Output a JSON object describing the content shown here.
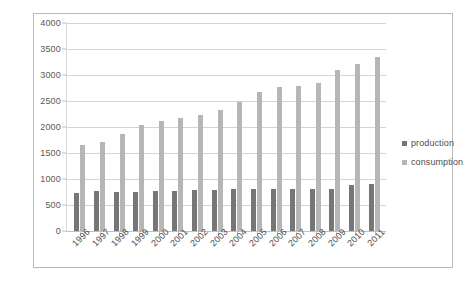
{
  "chart_data": {
    "type": "bar",
    "title": "",
    "xlabel": "",
    "ylabel": "",
    "ylim": [
      0,
      4000
    ],
    "y_ticks": [
      0,
      500,
      1000,
      1500,
      2000,
      2500,
      3000,
      3500,
      4000
    ],
    "grid": true,
    "legend_position": "right",
    "categories": [
      "1996",
      "1997",
      "1998",
      "1999",
      "2000",
      "2001",
      "2002",
      "2003",
      "2004",
      "2005",
      "2006",
      "2007",
      "2008",
      "2009",
      "2010",
      "2011"
    ],
    "series": [
      {
        "name": "production",
        "color": "#767676",
        "values": [
          730,
          760,
          745,
          750,
          760,
          765,
          785,
          790,
          815,
          800,
          800,
          800,
          800,
          800,
          880,
          900
        ]
      },
      {
        "name": "consumption",
        "color": "#b6b6b6",
        "values": [
          1650,
          1720,
          1860,
          2030,
          2120,
          2180,
          2230,
          2330,
          2490,
          2670,
          2760,
          2790,
          2840,
          3100,
          3210,
          3340
        ]
      }
    ]
  },
  "legend": {
    "items": [
      {
        "label": "production",
        "key": "production"
      },
      {
        "label": "consumption",
        "key": "consumption"
      }
    ]
  }
}
